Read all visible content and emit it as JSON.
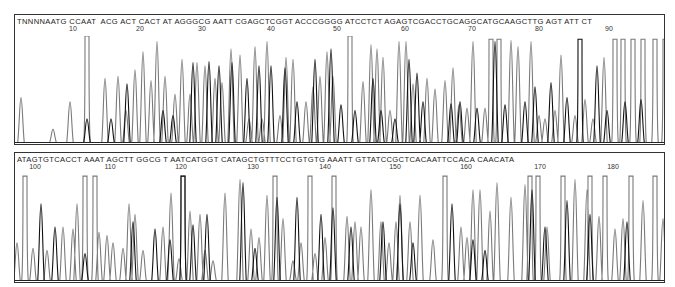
{
  "chart_data": {
    "type": "line",
    "title": "",
    "xlabel": "",
    "ylabel": "",
    "grid": false,
    "legend": "none",
    "panels": [
      {
        "sequence": "TNNNNAATGCCAATACGACTCACTATAGGGCGAATTCGAGCTCGGTACCCGGGGATCCTCTAGAGTCGACCTGCAGGCATGCAAGCTTGAGTATTCT",
        "sequence_display": "TNNNNAATG CCAAT  ACG ACT CACT AT AGGGCG AATT CGAGCTCGGT ACCCGGGG ATCCTCT AGAGTCGACCTGCAGGCATGCAAGCTTG AGT ATT CT",
        "tick_labels": [
          "10",
          "20",
          "30",
          "40",
          "50",
          "60",
          "70",
          "80",
          "90"
        ],
        "tick_x": [
          58,
          125,
          187,
          256,
          322,
          390,
          457,
          524,
          594
        ],
        "series": [
          {
            "name": "trace-gray",
            "peaks": [
              [
                6,
                0.42
              ],
              [
                38,
                0.12
              ],
              [
                55,
                0.38
              ],
              [
                72,
                1.0
              ],
              [
                90,
                0.6
              ],
              [
                103,
                0.62
              ],
              [
                111,
                0.3
              ],
              [
                120,
                0.68
              ],
              [
                128,
                0.85
              ],
              [
                136,
                0.58
              ],
              [
                142,
                0.95
              ],
              [
                150,
                0.62
              ],
              [
                160,
                0.45
              ],
              [
                167,
                0.78
              ],
              [
                175,
                0.45
              ],
              [
                182,
                0.75
              ],
              [
                190,
                0.72
              ],
              [
                200,
                0.6
              ],
              [
                207,
                0.56
              ],
              [
                216,
                0.88
              ],
              [
                225,
                0.82
              ],
              [
                234,
                0.22
              ],
              [
                240,
                0.9
              ],
              [
                247,
                0.22
              ],
              [
                252,
                0.95
              ],
              [
                265,
                0.25
              ],
              [
                271,
                0.8
              ],
              [
                278,
                0.78
              ],
              [
                291,
                0.38
              ],
              [
                298,
                0.52
              ],
              [
                305,
                0.62
              ],
              [
                312,
                0.85
              ],
              [
                318,
                0.62
              ],
              [
                335,
                1.0
              ],
              [
                348,
                0.57
              ],
              [
                356,
                0.92
              ],
              [
                362,
                0.88
              ],
              [
                368,
                0.8
              ],
              [
                375,
                0.3
              ],
              [
                384,
                0.95
              ],
              [
                391,
                0.95
              ],
              [
                398,
                0.55
              ],
              [
                412,
                0.6
              ],
              [
                420,
                0.5
              ],
              [
                430,
                0.58
              ],
              [
                438,
                0.7
              ],
              [
                444,
                0.35
              ],
              [
                452,
                0.32
              ],
              [
                458,
                0.95
              ],
              [
                470,
                0.32
              ],
              [
                476,
                0.97
              ],
              [
                484,
                0.97
              ],
              [
                496,
                0.96
              ],
              [
                503,
                0.9
              ],
              [
                516,
                0.95
              ],
              [
                524,
                0.25
              ],
              [
                530,
                0.22
              ],
              [
                540,
                0.3
              ],
              [
                546,
                0.82
              ],
              [
                560,
                0.25
              ],
              [
                570,
                0.4
              ],
              [
                578,
                0.22
              ],
              [
                589,
                0.8
              ],
              [
                600,
                0.97
              ],
              [
                608,
                0.97
              ],
              [
                618,
                0.97
              ],
              [
                628,
                0.97
              ],
              [
                640,
                0.97
              ],
              [
                650,
                0.97
              ]
            ]
          },
          {
            "name": "trace-black",
            "peaks": [
              [
                72,
                0.22
              ],
              [
                96,
                0.22
              ],
              [
                112,
                0.55
              ],
              [
                148,
                0.3
              ],
              [
                158,
                0.25
              ],
              [
                178,
                0.75
              ],
              [
                194,
                0.76
              ],
              [
                204,
                0.72
              ],
              [
                217,
                0.75
              ],
              [
                232,
                0.6
              ],
              [
                244,
                0.72
              ],
              [
                256,
                0.72
              ],
              [
                270,
                0.7
              ],
              [
                282,
                0.38
              ],
              [
                300,
                0.78
              ],
              [
                316,
                0.88
              ],
              [
                326,
                0.35
              ],
              [
                340,
                0.3
              ],
              [
                358,
                0.6
              ],
              [
                366,
                0.3
              ],
              [
                380,
                0.22
              ],
              [
                394,
                0.78
              ],
              [
                402,
                0.65
              ],
              [
                408,
                0.38
              ],
              [
                436,
                0.36
              ],
              [
                445,
                0.38
              ],
              [
                462,
                0.32
              ],
              [
                480,
                0.95
              ],
              [
                490,
                0.35
              ],
              [
                510,
                0.38
              ],
              [
                520,
                0.52
              ],
              [
                536,
                0.56
              ],
              [
                552,
                0.42
              ],
              [
                565,
                0.97
              ],
              [
                582,
                0.72
              ],
              [
                592,
                0.3
              ],
              [
                610,
                0.38
              ],
              [
                626,
                0.4
              ]
            ]
          }
        ]
      },
      {
        "sequence": "ATAGTGTCACCTAAATAGCTTGGCGTAATCATGGTCATAGCTGTTTCCTGTGTGAAATTGTTATCCGCTCACAATTCCACACAACATA",
        "sequence_display": "ATAGTGTCACCT AAAT AGCTT GGCG T AATCATGGT CATAGCTGTTTCCTGTGTG AAATT GTTATCCGCTCACAATTCCACA CAACATA",
        "tick_labels": [
          "100",
          "110",
          "120",
          "130",
          "140",
          "150",
          "160",
          "170",
          "180"
        ],
        "tick_x": [
          20,
          95,
          166,
          238,
          310,
          380,
          451,
          525,
          598
        ],
        "series": [
          {
            "name": "trace-gray",
            "peaks": [
              [
                2,
                0.35
              ],
              [
                10,
                0.98
              ],
              [
                18,
                0.3
              ],
              [
                32,
                0.28
              ],
              [
                48,
                0.5
              ],
              [
                58,
                0.48
              ],
              [
                62,
                0.72
              ],
              [
                70,
                0.98
              ],
              [
                80,
                0.98
              ],
              [
                84,
                0.45
              ],
              [
                92,
                0.42
              ],
              [
                98,
                0.35
              ],
              [
                108,
                0.3
              ],
              [
                114,
                0.72
              ],
              [
                120,
                0.62
              ],
              [
                128,
                0.28
              ],
              [
                148,
                0.5
              ],
              [
                156,
                0.82
              ],
              [
                164,
                0.2
              ],
              [
                168,
                0.98
              ],
              [
                175,
                0.65
              ],
              [
                185,
                0.62
              ],
              [
                190,
                0.28
              ],
              [
                198,
                0.18
              ],
              [
                210,
                0.82
              ],
              [
                225,
                0.95
              ],
              [
                236,
                0.48
              ],
              [
                244,
                0.4
              ],
              [
                252,
                0.8
              ],
              [
                260,
                0.98
              ],
              [
                268,
                0.58
              ],
              [
                278,
                0.18
              ],
              [
                286,
                0.35
              ],
              [
                295,
                0.98
              ],
              [
                300,
                0.25
              ],
              [
                310,
                0.4
              ],
              [
                319,
                0.98
              ],
              [
                332,
                0.6
              ],
              [
                340,
                0.55
              ],
              [
                346,
                0.5
              ],
              [
                356,
                0.85
              ],
              [
                366,
                0.55
              ],
              [
                374,
                0.35
              ],
              [
                381,
                0.55
              ],
              [
                385,
                0.8
              ],
              [
                395,
                0.55
              ],
              [
                405,
                0.8
              ],
              [
                418,
                0.38
              ],
              [
                430,
                0.98
              ],
              [
                446,
                0.5
              ],
              [
                452,
                0.4
              ],
              [
                458,
                0.85
              ],
              [
                465,
                0.85
              ],
              [
                475,
                0.65
              ],
              [
                482,
                0.92
              ],
              [
                496,
                0.78
              ],
              [
                510,
                0.9
              ],
              [
                515,
                0.98
              ],
              [
                523,
                0.98
              ],
              [
                532,
                0.5
              ],
              [
                548,
                0.98
              ],
              [
                560,
                0.95
              ],
              [
                572,
                0.85
              ],
              [
                575,
                0.98
              ],
              [
                584,
                0.6
              ],
              [
                590,
                0.98
              ],
              [
                600,
                0.48
              ],
              [
                608,
                0.58
              ],
              [
                616,
                0.98
              ],
              [
                628,
                0.75
              ],
              [
                640,
                0.98
              ],
              [
                648,
                0.58
              ]
            ]
          },
          {
            "name": "trace-black",
            "peaks": [
              [
                26,
                0.72
              ],
              [
                40,
                0.5
              ],
              [
                70,
                0.25
              ],
              [
                118,
                0.55
              ],
              [
                140,
                0.48
              ],
              [
                155,
                0.38
              ],
              [
                168,
                0.98
              ],
              [
                178,
                0.52
              ],
              [
                192,
                0.62
              ],
              [
                228,
                0.92
              ],
              [
                240,
                0.3
              ],
              [
                262,
                0.78
              ],
              [
                282,
                0.78
              ],
              [
                306,
                0.62
              ],
              [
                318,
                0.68
              ],
              [
                336,
                0.5
              ],
              [
                368,
                0.55
              ],
              [
                385,
                0.72
              ],
              [
                398,
                0.35
              ],
              [
                437,
                0.72
              ],
              [
                458,
                0.38
              ],
              [
                470,
                0.28
              ],
              [
                517,
                0.85
              ],
              [
                530,
                0.5
              ],
              [
                552,
                0.75
              ],
              [
                575,
                0.62
              ],
              [
                612,
                0.55
              ]
            ]
          }
        ]
      }
    ]
  },
  "panels": [
    {
      "ticks": [
        "10",
        "20",
        "30",
        "40",
        "50",
        "60",
        "70",
        "80",
        "90"
      ]
    },
    {
      "ticks": [
        "100",
        "110",
        "120",
        "130",
        "140",
        "150",
        "160",
        "170",
        "180"
      ]
    }
  ]
}
